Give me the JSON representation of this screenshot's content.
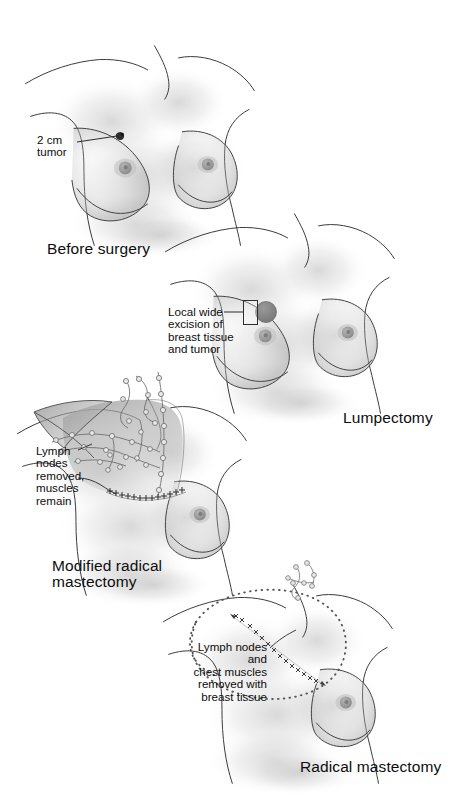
{
  "figure": {
    "width": 455,
    "height": 811,
    "background_color": "#ffffff",
    "line_color": "#3a3a3a",
    "shading_color": "#c9c9c9",
    "text_color": "#0d0d0d"
  },
  "panels": [
    {
      "id": "before-surgery",
      "caption": "Before surgery",
      "annotations": [
        {
          "id": "tumor",
          "text": "2 cm\ntumor",
          "align": "left",
          "marker": "tumor-dot"
        }
      ]
    },
    {
      "id": "lumpectomy",
      "caption": "Lumpectomy",
      "annotations": [
        {
          "id": "local-wide-excision",
          "text": "Local wide\nexcision of\nbreast tissue\nand tumor",
          "align": "left",
          "marker": "excision-box"
        }
      ]
    },
    {
      "id": "modified-radical-mastectomy",
      "caption": "Modified radical\nmastectomy",
      "annotations": [
        {
          "id": "lymph-nodes-removed",
          "text": "Lymph\nnodes\nremoved,\nmuscles\nremain",
          "align": "left",
          "marker": "lymph-node-chain"
        }
      ]
    },
    {
      "id": "radical-mastectomy",
      "caption": "Radical mastectomy",
      "annotations": [
        {
          "id": "lymph-nodes-chest-muscles",
          "text": "Lymph nodes\nand\nchest muscles\nremoved with\nbreast tissue",
          "align": "right",
          "marker": "dotted-excision-outline"
        }
      ]
    }
  ]
}
